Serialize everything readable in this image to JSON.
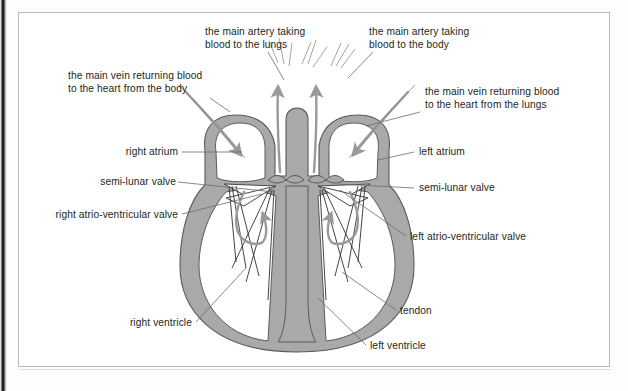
{
  "figure": {
    "colors": {
      "muscle_fill": "#a9a9a9",
      "muscle_stroke": "#5a5a5a",
      "chamber_fill": "#ffffff",
      "arrow": "#9a9a9a",
      "leader_line": "#6b6b6b",
      "text": "#231f20",
      "frame": "#b9b9b9",
      "page": "#ffffff"
    }
  },
  "labels": [
    {
      "id": "main-artery-lungs",
      "text": "the main artery taking\nblood to the lungs",
      "align": "left",
      "x": 205,
      "y": 26
    },
    {
      "id": "main-artery-body",
      "text": "the main artery taking\nblood to the body",
      "align": "left",
      "x": 369,
      "y": 26
    },
    {
      "id": "main-vein-body",
      "text": "the main vein returning blood\nto the heart from the body",
      "align": "left",
      "x": 68,
      "y": 70
    },
    {
      "id": "main-vein-lungs",
      "text": "the main vein returning blood\nto the heart from the lungs",
      "align": "left",
      "x": 425,
      "y": 86
    },
    {
      "id": "right-atrium",
      "text": "right atrium",
      "align": "right",
      "x": 118,
      "y": 146
    },
    {
      "id": "left-atrium",
      "text": "left atrium",
      "align": "left",
      "x": 417,
      "y": 146
    },
    {
      "id": "semi-lunar-valve-left",
      "text": "semi-lunar valve",
      "align": "right",
      "x": 96,
      "y": 176
    },
    {
      "id": "semi-lunar-valve-right",
      "text": "semi-lunar valve",
      "align": "left",
      "x": 417,
      "y": 182
    },
    {
      "id": "right-atrio-ventricular",
      "text": "right atrio-ventricular valve",
      "align": "right",
      "x": 28,
      "y": 209
    },
    {
      "id": "left-atrio-ventricular",
      "text": "left atrio-ventricular valve",
      "align": "left",
      "x": 409,
      "y": 231
    },
    {
      "id": "right-ventricle",
      "text": "right ventricle",
      "align": "right",
      "x": 114,
      "y": 317
    },
    {
      "id": "tendon",
      "text": "tendon",
      "align": "left",
      "x": 400,
      "y": 305
    },
    {
      "id": "left-ventricle",
      "text": "left ventricle",
      "align": "left",
      "x": 370,
      "y": 340
    }
  ],
  "anatomy_parts": [
    "right atrium",
    "left atrium",
    "right ventricle",
    "left ventricle",
    "semi-lunar valve",
    "right atrio-ventricular valve",
    "left atrio-ventricular valve",
    "tendon",
    "main artery to the lungs",
    "main artery to the body",
    "main vein from the body",
    "main vein from the lungs"
  ],
  "flow_arrows": [
    {
      "id": "inflow-right-atrium",
      "direction": "down-right",
      "meaning": "blood from body entering right atrium"
    },
    {
      "id": "inflow-left-atrium",
      "direction": "down-left",
      "meaning": "blood from lungs entering left atrium"
    },
    {
      "id": "outflow-pulmonary",
      "direction": "up",
      "meaning": "blood leaving to the lungs"
    },
    {
      "id": "outflow-aorta",
      "direction": "up",
      "meaning": "blood leaving to the body"
    },
    {
      "id": "right-ventricle-out",
      "direction": "up",
      "meaning": "right ventricle pumping out"
    },
    {
      "id": "left-ventricle-out",
      "direction": "up",
      "meaning": "left ventricle pumping out"
    }
  ]
}
